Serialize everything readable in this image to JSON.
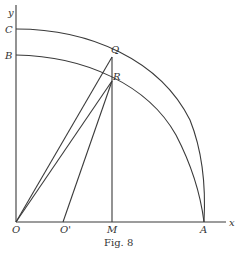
{
  "figure": {
    "caption": "Fig. 8",
    "axes": {
      "x_label": "x",
      "y_label": "y"
    },
    "points": {
      "O": "O",
      "O_prime": "O'",
      "M": "M",
      "A": "A",
      "B": "B",
      "C": "C",
      "Q": "Q",
      "R": "R"
    },
    "colors": {
      "ink": "#3a3a3a",
      "background": "#ffffff"
    }
  }
}
